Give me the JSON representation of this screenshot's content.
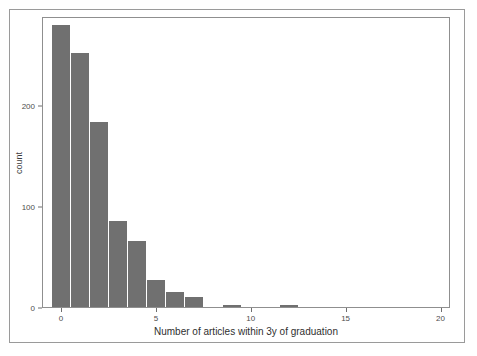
{
  "chart_data": {
    "type": "bar",
    "title": "",
    "subtitle": "",
    "xlabel": "Number of articles within 3y of graduation",
    "ylabel": "count",
    "xlim": [
      -1,
      20.5
    ],
    "ylim": [
      0,
      288
    ],
    "grid": false,
    "legend": null,
    "bar_color": "#707070",
    "panel_background": "#ffffff",
    "binwidth": 1,
    "x_ticks": [
      0,
      5,
      10,
      15,
      20
    ],
    "x_tick_labels": [
      "0",
      "5",
      "10",
      "15",
      "20"
    ],
    "y_ticks": [
      0,
      100,
      200
    ],
    "y_tick_labels": [
      "0",
      "100",
      "200"
    ],
    "categories": [
      0,
      1,
      2,
      3,
      4,
      5,
      6,
      7,
      9,
      12
    ],
    "values": [
      279,
      251,
      183,
      85,
      65,
      27,
      15,
      10,
      2,
      2
    ],
    "bars": [
      {
        "x": 0,
        "count": 279
      },
      {
        "x": 1,
        "count": 251
      },
      {
        "x": 2,
        "count": 183
      },
      {
        "x": 3,
        "count": 85
      },
      {
        "x": 4,
        "count": 65
      },
      {
        "x": 5,
        "count": 27
      },
      {
        "x": 6,
        "count": 15
      },
      {
        "x": 7,
        "count": 10
      },
      {
        "x": 9,
        "count": 2
      },
      {
        "x": 12,
        "count": 2
      }
    ]
  },
  "figure": {
    "frame_color": "#9a9a9a",
    "panel_border_color": "#8f8f8f",
    "axis_text_color": "#4d4d4d"
  }
}
